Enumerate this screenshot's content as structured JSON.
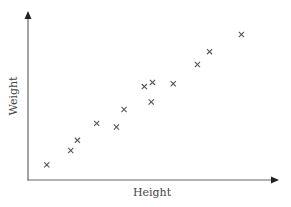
{
  "chart_data": {
    "type": "scatter",
    "title": "",
    "xlabel": "Height",
    "ylabel": "Weight",
    "marker": "x",
    "grid": false,
    "ticks": false,
    "legend": null,
    "colors": {
      "axis": "#666666",
      "marker": "#555555",
      "text": "#444444"
    },
    "xlim": [
      0,
      10
    ],
    "ylim": [
      0,
      10
    ],
    "points": [
      {
        "x": 0.76,
        "y": 0.9
      },
      {
        "x": 1.73,
        "y": 1.76
      },
      {
        "x": 2.0,
        "y": 2.36
      },
      {
        "x": 2.78,
        "y": 3.37
      },
      {
        "x": 3.58,
        "y": 3.15
      },
      {
        "x": 3.89,
        "y": 4.2
      },
      {
        "x": 4.71,
        "y": 5.56
      },
      {
        "x": 5.04,
        "y": 5.81
      },
      {
        "x": 4.99,
        "y": 4.64
      },
      {
        "x": 5.88,
        "y": 5.73
      },
      {
        "x": 6.86,
        "y": 6.88
      },
      {
        "x": 7.35,
        "y": 7.64
      },
      {
        "x": 8.64,
        "y": 8.66
      }
    ]
  },
  "plot_px": {
    "origin_x": 28,
    "origin_y": 180,
    "x_end": 278,
    "y_end": 12,
    "x_scale": 24.7,
    "y_scale": 16.8
  }
}
